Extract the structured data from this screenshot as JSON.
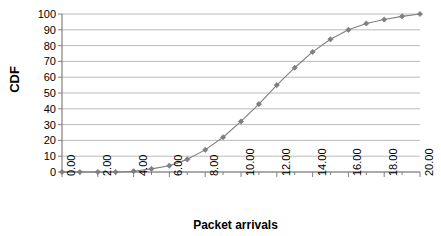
{
  "chart_data": {
    "type": "line",
    "title": "",
    "xlabel": "Packet arrivals",
    "ylabel": "CDF",
    "xlim": [
      0,
      20
    ],
    "ylim": [
      0,
      100
    ],
    "grid": true,
    "legend": false,
    "marker": "diamond",
    "series_color": "#808080",
    "grid_color": "#aaaaaa",
    "axis_color": "#808080",
    "x": [
      0,
      1,
      2,
      3,
      4,
      5,
      6,
      7,
      8,
      9,
      10,
      11,
      12,
      13,
      14,
      15,
      16,
      17,
      18,
      19,
      20
    ],
    "values": [
      0,
      0,
      0,
      0,
      0.5,
      2,
      4,
      8,
      14,
      22,
      32,
      43,
      55,
      66,
      76,
      84,
      90,
      94,
      96.5,
      98.5,
      100
    ],
    "xticks": [
      0,
      2,
      4,
      6,
      8,
      10,
      12,
      14,
      16,
      18,
      20
    ],
    "xticklabels": [
      "0.00",
      "2.00",
      "4.00",
      "6.00",
      "8.00",
      "10.00",
      "12.00",
      "14.00",
      "16.00",
      "18.00",
      "20.00"
    ],
    "yticks": [
      0,
      10,
      20,
      30,
      40,
      50,
      60,
      70,
      80,
      90,
      100
    ],
    "yticklabels": [
      "0",
      "10",
      "20",
      "30",
      "40",
      "50",
      "60",
      "70",
      "80",
      "90",
      "100"
    ]
  }
}
